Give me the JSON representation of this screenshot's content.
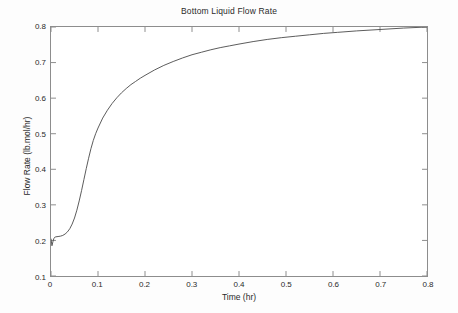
{
  "chart_data": {
    "type": "line",
    "title": "Bottom Liquid Flow Rate",
    "xlabel": "Time (hr)",
    "ylabel": "Flow Rate (lb.mol/hr)",
    "xlim": [
      0,
      0.8
    ],
    "ylim": [
      0.1,
      0.8
    ],
    "xticks": [
      "0",
      "0.1",
      "0.2",
      "0.3",
      "0.4",
      "0.5",
      "0.6",
      "0.7",
      "0.8"
    ],
    "xtick_values": [
      0,
      0.1,
      0.2,
      0.3,
      0.4,
      0.5,
      0.6,
      0.7,
      0.8
    ],
    "yticks": [
      "0.1",
      "0.2",
      "0.3",
      "0.4",
      "0.5",
      "0.6",
      "0.7",
      "0.8"
    ],
    "ytick_values": [
      0.1,
      0.2,
      0.3,
      0.4,
      0.5,
      0.6,
      0.7,
      0.8
    ],
    "grid": false,
    "legend": null,
    "line_color": "#4a4a4a",
    "line_width": 0.9,
    "series": [
      {
        "name": "Bottom liquid flow rate",
        "x": [
          0.0,
          0.002,
          0.004,
          0.006,
          0.008,
          0.01,
          0.015,
          0.02,
          0.025,
          0.03,
          0.035,
          0.04,
          0.045,
          0.05,
          0.055,
          0.06,
          0.065,
          0.07,
          0.075,
          0.08,
          0.085,
          0.09,
          0.095,
          0.1,
          0.11,
          0.12,
          0.13,
          0.14,
          0.15,
          0.16,
          0.17,
          0.18,
          0.19,
          0.2,
          0.22,
          0.24,
          0.26,
          0.28,
          0.3,
          0.32,
          0.34,
          0.36,
          0.38,
          0.4,
          0.43,
          0.46,
          0.49,
          0.52,
          0.55,
          0.58,
          0.61,
          0.65,
          0.7,
          0.75,
          0.8
        ],
        "y": [
          0.205,
          0.185,
          0.196,
          0.205,
          0.209,
          0.21,
          0.211,
          0.212,
          0.214,
          0.218,
          0.224,
          0.233,
          0.246,
          0.263,
          0.285,
          0.311,
          0.34,
          0.371,
          0.402,
          0.431,
          0.458,
          0.481,
          0.5,
          0.516,
          0.544,
          0.566,
          0.585,
          0.601,
          0.615,
          0.627,
          0.638,
          0.647,
          0.656,
          0.664,
          0.679,
          0.692,
          0.703,
          0.713,
          0.722,
          0.729,
          0.736,
          0.742,
          0.747,
          0.752,
          0.759,
          0.765,
          0.77,
          0.774,
          0.778,
          0.782,
          0.785,
          0.789,
          0.793,
          0.797,
          0.8
        ]
      }
    ]
  }
}
